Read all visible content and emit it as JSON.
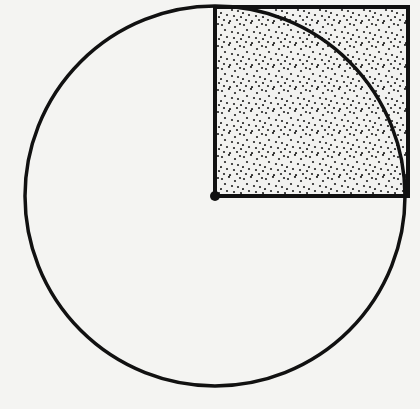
{
  "diagram": {
    "canvas": {
      "width": 420,
      "height": 409,
      "background": "#f4f4f2"
    },
    "circle": {
      "cx": 215,
      "cy": 196,
      "r": 190,
      "stroke": "#111111",
      "stroke_width": 3.5
    },
    "square": {
      "x": 215,
      "y": 7,
      "size": 193,
      "stroke": "#111111",
      "stroke_width": 4,
      "fill": "#f2f2f0",
      "pattern": "stipple-dots",
      "dot_color": "#222222"
    },
    "center_point": {
      "cx": 215,
      "cy": 196,
      "r": 5,
      "fill": "#111111"
    }
  }
}
